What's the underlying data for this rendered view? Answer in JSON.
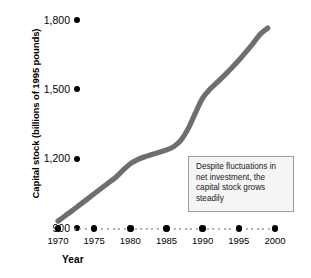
{
  "chart_data": {
    "type": "line",
    "title": "",
    "xlabel": "Year",
    "ylabel": "Capital stock (billions of 1995 pounds)",
    "xlim": [
      1970,
      2000
    ],
    "ylim": [
      900,
      1800
    ],
    "grid": false,
    "legend": null,
    "xticks": [
      1970,
      1975,
      1980,
      1985,
      1990,
      1995,
      2000
    ],
    "xtick_labels": [
      "1970",
      "1975",
      "1980",
      "1985",
      "1990",
      "1995",
      "2000"
    ],
    "yticks": [
      900,
      1200,
      1500,
      1800
    ],
    "ytick_labels": [
      "900",
      "1,200",
      "1,500",
      "1,800"
    ],
    "series": [
      {
        "name": "Capital stock",
        "color": "#6e6e6e",
        "x": [
          1970,
          1971,
          1972,
          1973,
          1974,
          1975,
          1976,
          1977,
          1978,
          1979,
          1980,
          1981,
          1982,
          1983,
          1984,
          1985,
          1986,
          1987,
          1988,
          1989,
          1990,
          1991,
          1992,
          1993,
          1994,
          1995,
          1996,
          1997,
          1998,
          1999
        ],
        "values": [
          930,
          953,
          976,
          1000,
          1024,
          1048,
          1072,
          1096,
          1120,
          1150,
          1178,
          1196,
          1208,
          1218,
          1228,
          1238,
          1252,
          1280,
          1330,
          1398,
          1462,
          1500,
          1530,
          1560,
          1592,
          1626,
          1662,
          1700,
          1740,
          1765
        ]
      }
    ],
    "annotations": [
      {
        "name": "callout",
        "text": "Despite fluctuations in net investment, the capital stock grows steadily",
        "border_color": "#9d9d9d",
        "fill_color": "#f5f5f5"
      }
    ]
  },
  "axes": {
    "y_title": "Capital stock (billions of 1995 pounds)",
    "x_title": "Year",
    "y_ticks": [
      {
        "label": "1,800",
        "value": 1800
      },
      {
        "label": "1,500",
        "value": 1500
      },
      {
        "label": "1,200",
        "value": 1200
      },
      {
        "label": "900",
        "value": 900
      }
    ],
    "x_ticks": [
      {
        "label": "1970",
        "value": 1970
      },
      {
        "label": "1975",
        "value": 1975
      },
      {
        "label": "1980",
        "value": 1980
      },
      {
        "label": "1985",
        "value": 1985
      },
      {
        "label": "1990",
        "value": 1990
      },
      {
        "label": "1995",
        "value": 1995
      },
      {
        "label": "2000",
        "value": 2000
      }
    ]
  },
  "annotation": {
    "text": "Despite fluctuations in net investment, the capital stock grows steadily"
  },
  "colors": {
    "line": "#6e6e6e",
    "axis_dot": "#000000",
    "axis_minor_dot": "#9a9a9a",
    "annotation_border": "#9d9d9d",
    "annotation_fill": "#f5f5f5",
    "background": "#ffffff"
  }
}
